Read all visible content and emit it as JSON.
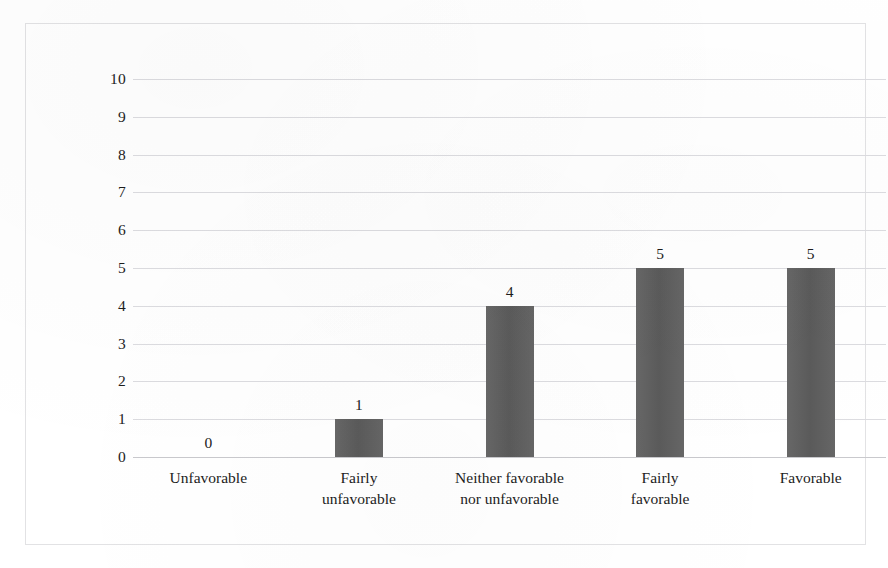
{
  "figure": {
    "frame_color": "#e2e2e4",
    "background": "#ffffff"
  },
  "chart_data": {
    "type": "bar",
    "title": "",
    "subtitle": "",
    "xlabel": "",
    "ylabel": "Numbers of the participants",
    "ylim": [
      0,
      10
    ],
    "ytick_labels": [
      "10",
      "9",
      "8",
      "7",
      "6",
      "5",
      "4",
      "3",
      "2",
      "1",
      "0"
    ],
    "yticks": [
      10,
      9,
      8,
      7,
      6,
      5,
      4,
      3,
      2,
      1,
      0
    ],
    "grid": "horizontal",
    "legend": "none",
    "bar_color": "#5f5f5f",
    "categories": [
      "Unfavorable",
      "Fairly unfavorable",
      "Neither favorable nor unfavorable",
      "Fairly favorable",
      "Favorable"
    ],
    "category_lines": [
      [
        "Unfavorable"
      ],
      [
        "Fairly",
        "unfavorable"
      ],
      [
        "Neither favorable",
        "nor unfavorable"
      ],
      [
        "Fairly",
        "favorable"
      ],
      [
        "Favorable"
      ]
    ],
    "values": [
      0,
      1,
      4,
      5,
      5
    ],
    "data_labels": [
      "0",
      "1",
      "4",
      "5",
      "5"
    ]
  }
}
